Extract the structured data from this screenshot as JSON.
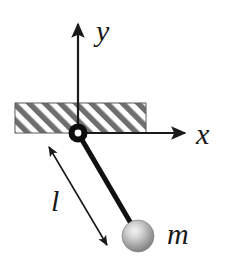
{
  "figure": {
    "name": "simple-pendulum-diagram",
    "background_color": "#ffffff",
    "stroke_color": "#1a1a1a",
    "hatch_color": "#6e6e6e",
    "bob_color": "#9a9a9a",
    "bob_highlight_color": "#e8e8e8"
  },
  "labels": {
    "y_axis": "y",
    "x_axis": "x",
    "length": "l",
    "mass": "m"
  },
  "geometry": {
    "pivot": {
      "x": 78,
      "y": 133
    },
    "bob_center": {
      "x": 138,
      "y": 236
    },
    "bob_radius": 16,
    "rod_length_px": 119,
    "y_axis_tip": {
      "x": 78,
      "y": 20
    },
    "x_axis_tip": {
      "x": 189,
      "y": 133
    },
    "ceiling_band": {
      "left": 15,
      "top": 103,
      "right": 146,
      "bottom": 133
    },
    "dimension_arrow_start": {
      "x": 46,
      "y": 142
    },
    "dimension_arrow_end": {
      "x": 110,
      "y": 249
    }
  }
}
